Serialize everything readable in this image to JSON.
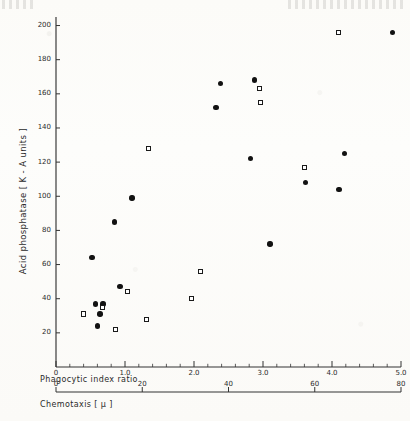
{
  "figure": {
    "kind": "hand-drawn-scatter-plot",
    "paper_note": "scanned page with faint header speckle"
  },
  "axes": {
    "y": {
      "title": "Acid  phosphatase  [ K - A  units ]",
      "ticks": [
        20,
        40,
        60,
        80,
        100,
        120,
        140,
        160,
        180,
        200
      ],
      "tick_labels": [
        "20",
        "40",
        "60",
        "80",
        "100",
        "120",
        "140",
        "160",
        "180",
        "200"
      ],
      "min": 0,
      "max": 205
    },
    "x_upper": {
      "title": "Phagocytic  index  ratio",
      "ticks": [
        0,
        1.0,
        2.0,
        3.0,
        4.0,
        5.0
      ],
      "tick_labels": [
        "0",
        "1.0",
        "2.0",
        "3.0",
        "4.0",
        "5.0"
      ],
      "minor_per_major": 5,
      "min": 0,
      "max": 5.0
    },
    "x_lower": {
      "title": "Chemotaxis  [ μ ]",
      "ticks": [
        0,
        20,
        40,
        60,
        80
      ],
      "tick_labels": [
        "0",
        "20",
        "40",
        "60",
        "80"
      ],
      "min": 0,
      "max": 80
    }
  },
  "chart_data": {
    "type": "scatter",
    "title": "",
    "xlabel": "Phagocytic index ratio / Chemotaxis [μ]",
    "ylabel": "Acid phosphatase [K-A units]",
    "xlim": [
      0,
      5.0
    ],
    "ylim": [
      0,
      205
    ],
    "grid": false,
    "legend": "none",
    "series": [
      {
        "name": "filled-circle",
        "marker": "filled circle",
        "color": "#121212",
        "points": [
          {
            "x": 0.6,
            "y": 24
          },
          {
            "x": 0.57,
            "y": 37
          },
          {
            "x": 0.68,
            "y": 37
          },
          {
            "x": 0.64,
            "y": 31
          },
          {
            "x": 0.52,
            "y": 64
          },
          {
            "x": 0.93,
            "y": 47
          },
          {
            "x": 0.85,
            "y": 85
          },
          {
            "x": 1.1,
            "y": 99
          },
          {
            "x": 2.32,
            "y": 152
          },
          {
            "x": 2.38,
            "y": 166
          },
          {
            "x": 2.88,
            "y": 168
          },
          {
            "x": 2.82,
            "y": 122
          },
          {
            "x": 3.1,
            "y": 72
          },
          {
            "x": 3.62,
            "y": 108
          },
          {
            "x": 4.1,
            "y": 104
          },
          {
            "x": 4.18,
            "y": 125
          },
          {
            "x": 4.88,
            "y": 196
          }
        ]
      },
      {
        "name": "open-square",
        "marker": "open square",
        "color": "#1a1a1a",
        "points": [
          {
            "x": 0.4,
            "y": 31
          },
          {
            "x": 0.67,
            "y": 35
          },
          {
            "x": 0.86,
            "y": 22
          },
          {
            "x": 1.04,
            "y": 44
          },
          {
            "x": 1.31,
            "y": 28
          },
          {
            "x": 1.34,
            "y": 128
          },
          {
            "x": 1.96,
            "y": 40
          },
          {
            "x": 2.1,
            "y": 56
          },
          {
            "x": 2.95,
            "y": 163
          },
          {
            "x": 2.96,
            "y": 155
          },
          {
            "x": 3.6,
            "y": 117
          },
          {
            "x": 4.1,
            "y": 196
          }
        ]
      }
    ]
  }
}
